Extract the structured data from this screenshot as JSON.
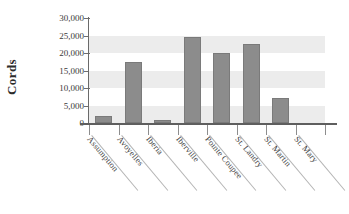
{
  "chart_data": {
    "type": "bar",
    "title": "",
    "subtitle": "",
    "xlabel": "",
    "ylabel": "Cords",
    "categories": [
      "Assumption",
      "Avoyelles",
      "Iberia",
      "Iberville",
      "Pointe Coupee",
      "St. Landry",
      "St. Martin",
      "St. Mary"
    ],
    "values": [
      2000,
      17300,
      1000,
      24500,
      20000,
      22700,
      7200,
      0
    ],
    "ylim": [
      0,
      30000
    ],
    "ytick_labels": [
      "30,000",
      "25,000",
      "20,000",
      "15,000",
      "10,000",
      "5,000",
      "0"
    ],
    "ytick_values": [
      30000,
      25000,
      20000,
      15000,
      10000,
      5000,
      0
    ],
    "grid": "horizontal-bands",
    "legend": "none",
    "bar_color": "#8c8c8c",
    "band_color": "#ececec",
    "axis_color": "#6a6a6a",
    "background": "#ffffff"
  }
}
